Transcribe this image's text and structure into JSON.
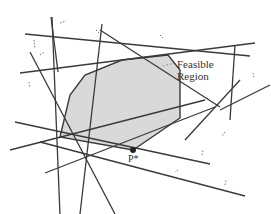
{
  "diagram": {
    "labels": {
      "feasible_line1": "Feasible",
      "feasible_line2": "Region",
      "optimal_point": "P*"
    },
    "colors": {
      "line": "#3a3a3a",
      "region_fill": "#d9d9d9",
      "point": "#222222",
      "arrow": "#777777"
    },
    "constraint_lines": [
      [
        25,
        34,
        250,
        56
      ],
      [
        20,
        73,
        255,
        43
      ],
      [
        51,
        17,
        58,
        72
      ],
      [
        52,
        17,
        60,
        215
      ],
      [
        30,
        52,
        115,
        214
      ],
      [
        102,
        24,
        80,
        214
      ],
      [
        100,
        30,
        220,
        107
      ],
      [
        10,
        150,
        205,
        100
      ],
      [
        15,
        122,
        210,
        164
      ],
      [
        40,
        142,
        245,
        196
      ],
      [
        45,
        173,
        215,
        107
      ],
      [
        235,
        45,
        230,
        120
      ],
      [
        240,
        80,
        185,
        140
      ],
      [
        270,
        85,
        220,
        110
      ]
    ],
    "polygon": [
      [
        122,
        60
      ],
      [
        168,
        55
      ],
      [
        180,
        70
      ],
      [
        180,
        118
      ],
      [
        133,
        150
      ],
      [
        60,
        137
      ],
      [
        70,
        95
      ],
      [
        85,
        75
      ]
    ],
    "arrows": [
      [
        60,
        23,
        66,
        21
      ],
      [
        34,
        40,
        35,
        48
      ],
      [
        40,
        55,
        44,
        52
      ],
      [
        29,
        82,
        30,
        88
      ],
      [
        96,
        30,
        99,
        33
      ],
      [
        160,
        35,
        163,
        38
      ],
      [
        253,
        73,
        254,
        77
      ],
      [
        225,
        132,
        222,
        136
      ],
      [
        202,
        155,
        203,
        150
      ],
      [
        178,
        170,
        175,
        172
      ],
      [
        225,
        185,
        226,
        180
      ]
    ]
  }
}
